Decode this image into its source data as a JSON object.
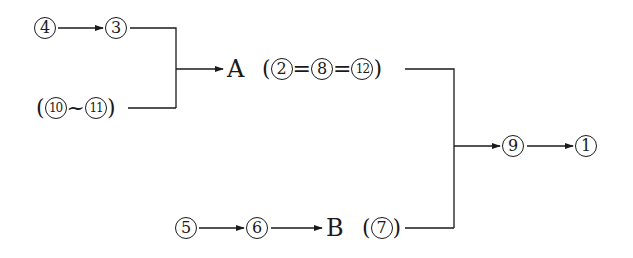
{
  "diagram": {
    "type": "flow",
    "nodes": {
      "n4": {
        "label": "4"
      },
      "n3": {
        "label": "3"
      },
      "group_10_11": {
        "open": "(",
        "first": "10",
        "sep": "~",
        "second": "11",
        "close": ")"
      },
      "A": {
        "label": "A"
      },
      "group_A": {
        "open": "(",
        "first": "2",
        "eq1": "=",
        "second": "8",
        "eq2": "=",
        "third": "12",
        "close": ")"
      },
      "n5": {
        "label": "5"
      },
      "n6": {
        "label": "6"
      },
      "B": {
        "label": "B"
      },
      "group_B": {
        "open": "(",
        "first": "7",
        "close": ")"
      },
      "n9": {
        "label": "9"
      },
      "n1": {
        "label": "1"
      }
    },
    "edges": [
      {
        "from": "4",
        "to": "3"
      },
      {
        "from": "3",
        "to": "A",
        "merge": true
      },
      {
        "from": "(10~11)",
        "to": "A",
        "merge": true
      },
      {
        "from": "A (2=8=12)",
        "to": "9",
        "merge": true
      },
      {
        "from": "5",
        "to": "6"
      },
      {
        "from": "6",
        "to": "B"
      },
      {
        "from": "B (7)",
        "to": "9",
        "merge": true
      },
      {
        "from": "9",
        "to": "1"
      }
    ],
    "colors": {
      "ink": "#1a1a1a",
      "background": "#ffffff"
    }
  }
}
